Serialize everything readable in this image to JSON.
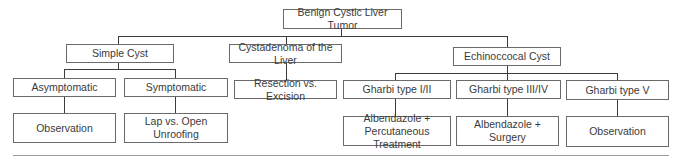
{
  "diagram": {
    "type": "tree",
    "root": "Benign Cystic Liver Tumor",
    "nodes": {
      "root": "Benign Cystic Liver Tumor",
      "simple_cyst": "Simple Cyst",
      "cystadenoma": "Cystadenoma of the Liver",
      "echinococcal": "Echinoccocal Cyst",
      "asymptomatic": "Asymptomatic",
      "symptomatic": "Symptomatic",
      "resection": "Resection vs. Excision",
      "gharbi_1_2": "Gharbi type I/II",
      "gharbi_3_4": "Gharbi type III/IV",
      "gharbi_5": "Gharbi type V",
      "observation_1": "Observation",
      "lap_open": "Lap vs. Open Unroofing",
      "albendazole_perc": "Albendazole +\nPercutaneous Treatment",
      "albendazole_surgery": "Albendazole +\nSurgery",
      "observation_2": "Observation"
    },
    "edges": [
      [
        "root",
        "simple_cyst"
      ],
      [
        "root",
        "cystadenoma"
      ],
      [
        "root",
        "echinococcal"
      ],
      [
        "simple_cyst",
        "asymptomatic"
      ],
      [
        "simple_cyst",
        "symptomatic"
      ],
      [
        "cystadenoma",
        "resection"
      ],
      [
        "echinococcal",
        "gharbi_1_2"
      ],
      [
        "echinococcal",
        "gharbi_3_4"
      ],
      [
        "echinococcal",
        "gharbi_5"
      ],
      [
        "asymptomatic",
        "observation_1"
      ],
      [
        "symptomatic",
        "lap_open"
      ],
      [
        "gharbi_1_2",
        "albendazole_perc"
      ],
      [
        "gharbi_3_4",
        "albendazole_surgery"
      ],
      [
        "gharbi_5",
        "observation_2"
      ]
    ]
  }
}
